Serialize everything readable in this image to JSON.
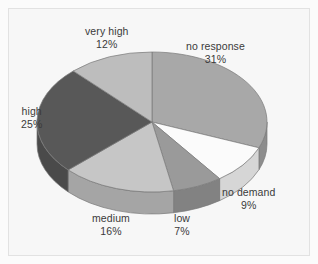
{
  "chart_data": {
    "type": "pie",
    "title": "",
    "subtitle": "",
    "xlabel": "",
    "ylabel": "",
    "legend_position": "none",
    "grid": false,
    "style": "3d-pie",
    "labels_show_percent": true,
    "categories": [
      "no response",
      "no demand",
      "low",
      "medium",
      "high",
      "very high"
    ],
    "values": [
      31,
      9,
      7,
      16,
      25,
      12
    ],
    "units": "%",
    "slices": [
      {
        "label": "no response",
        "value": 31,
        "percent_text": "31%",
        "color": "#a8a8a8",
        "side_color": "#8d8d8d",
        "start_angle": 0,
        "end_angle": 111.6
      },
      {
        "label": "no demand",
        "value": 9,
        "percent_text": "9%",
        "color": "#fbfbfb",
        "side_color": "#d6d6d6",
        "start_angle": 111.6,
        "end_angle": 144.0
      },
      {
        "label": "low",
        "value": 7,
        "percent_text": "7%",
        "color": "#9a9a9a",
        "side_color": "#828282",
        "start_angle": 144.0,
        "end_angle": 169.2
      },
      {
        "label": "medium",
        "value": 16,
        "percent_text": "16%",
        "color": "#c6c6c6",
        "side_color": "#a5a5a5",
        "start_angle": 169.2,
        "end_angle": 226.8
      },
      {
        "label": "high",
        "value": 25,
        "percent_text": "25%",
        "color": "#585858",
        "side_color": "#4a4a4a",
        "start_angle": 226.8,
        "end_angle": 316.8
      },
      {
        "label": "very high",
        "value": 12,
        "percent_text": "12%",
        "color": "#bdbdbd",
        "side_color": "#9e9e9e",
        "start_angle": 316.8,
        "end_angle": 360.0
      }
    ],
    "colors": {
      "background": "#f7f7f7",
      "frame_border": "#e2e2e2",
      "label_text": "#3a3a3a",
      "slice_outline": "#7a7a7a"
    }
  }
}
